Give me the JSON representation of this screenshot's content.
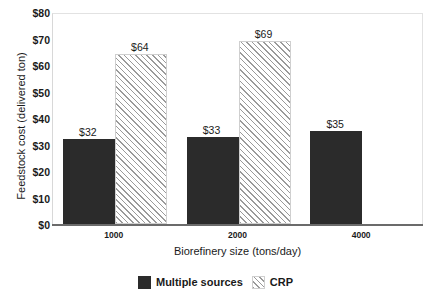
{
  "chart_data": {
    "type": "bar",
    "title": "",
    "xlabel": "Biorefinery size (tons/day)",
    "ylabel": "Feedstock cost (delivered ton)",
    "categories": [
      "1000",
      "2000",
      "4000"
    ],
    "series": [
      {
        "name": "Multiple sources",
        "color": "#2b2b2b",
        "pattern": "solid",
        "values": [
          32,
          33,
          35
        ],
        "labels": [
          "$32",
          "$33",
          "$35"
        ]
      },
      {
        "name": "CRP",
        "color": "#fbfbfb",
        "pattern": "diagonal-hatch",
        "values": [
          64,
          69,
          null
        ],
        "labels": [
          "$64",
          "$69",
          null
        ]
      }
    ],
    "ylim": [
      0,
      80
    ],
    "ytick_values": [
      0,
      10,
      20,
      30,
      40,
      50,
      60,
      70,
      80
    ],
    "ytick_labels": [
      "$0",
      "$10",
      "$20",
      "$30",
      "$40",
      "$50",
      "$60",
      "$70",
      "$80"
    ],
    "ytick_prefix": "$",
    "grid": false,
    "legend_position": "bottom",
    "legend_entries": [
      "Multiple sources",
      "CRP"
    ]
  },
  "axes": {
    "y_title": "Feedstock cost (delivered ton)",
    "x_title": "Biorefinery size (tons/day)"
  },
  "legend": {
    "items": [
      {
        "label": "Multiple sources",
        "swatch": "solid-dark-swatch"
      },
      {
        "label": "CRP",
        "swatch": "hatched-swatch"
      }
    ]
  }
}
